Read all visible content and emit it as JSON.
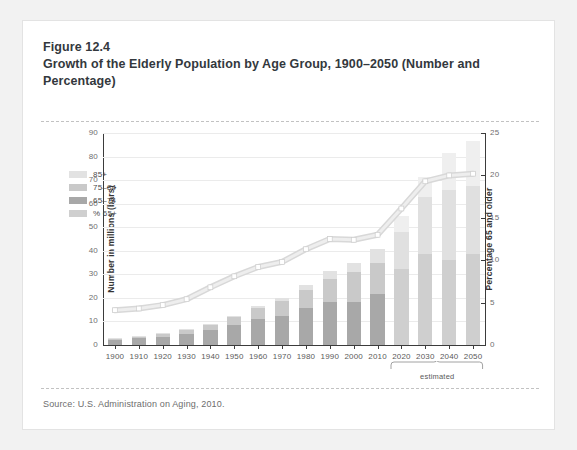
{
  "figure": {
    "number": "Figure 12.4",
    "title": "Growth of the Elderly Population by Age Group, 1900–2050 (Number and Percentage)",
    "source": "Source: U.S. Administration on Aging, 2010."
  },
  "colors": {
    "card_background": "#ffffff",
    "page_background": "#f2f2f2",
    "seg_65_74": "#a8a8a8",
    "seg_75_84": "#c9c9c9",
    "seg_85_plus": "#e2e2e2",
    "seg_65_74_proj": "#cfcfcf",
    "seg_75_84_proj": "#e0e0e0",
    "seg_85_plus_proj": "#efefef",
    "line_percent": "#cfcfcf",
    "line_marker": "#ffffff",
    "axis": "#3b3b3b",
    "gridline": "#ebebeb",
    "dashed_rule": "#c2c2c2"
  },
  "chart_data": {
    "type": "bar",
    "title": "Growth of the Elderly Population by Age Group, 1900–2050 (Number and Percentage)",
    "xlabel": "",
    "ylabel": "Number in millions (bars)",
    "y2label": "Percentage 65 and older",
    "ylim": [
      0,
      90
    ],
    "y2lim": [
      0,
      25
    ],
    "yticks": [
      0,
      10,
      20,
      30,
      40,
      50,
      60,
      70,
      80,
      90
    ],
    "y2ticks": [
      0,
      5,
      10,
      15,
      20,
      25
    ],
    "grid": true,
    "legend_position": "upper-left-inside",
    "stacked": true,
    "categories": [
      "1900",
      "1910",
      "1920",
      "1930",
      "1940",
      "1950",
      "1960",
      "1970",
      "1980",
      "1990",
      "2000",
      "2010",
      "2020",
      "2030",
      "2040",
      "2050"
    ],
    "projected_categories": [
      "2020",
      "2030",
      "2040",
      "2050"
    ],
    "annotation": "estimated",
    "series": [
      {
        "name": "65–74",
        "axis": "left",
        "values": [
          2.2,
          2.8,
          3.5,
          4.7,
          6.4,
          8.4,
          11.0,
          12.5,
          15.6,
          18.1,
          18.4,
          21.7,
          32.3,
          38.6,
          36.0,
          38.5
        ]
      },
      {
        "name": "75–84",
        "axis": "left",
        "values": [
          0.8,
          1.0,
          1.3,
          1.8,
          2.3,
          3.3,
          4.6,
          6.1,
          7.7,
          10.1,
          12.4,
          13.1,
          15.8,
          24.1,
          30.0,
          29.2
        ]
      },
      {
        "name": "85+",
        "axis": "left",
        "values": [
          0.1,
          0.2,
          0.2,
          0.3,
          0.4,
          0.6,
          0.9,
          1.4,
          2.2,
          3.1,
          4.2,
          5.8,
          6.6,
          8.7,
          15.4,
          19.0
        ]
      },
      {
        "name": "% 65+",
        "axis": "right",
        "type": "line",
        "values": [
          4.1,
          4.3,
          4.7,
          5.4,
          6.8,
          8.1,
          9.2,
          9.8,
          11.3,
          12.5,
          12.4,
          13.0,
          16.1,
          19.3,
          20.0,
          20.2
        ]
      }
    ],
    "totals": [
      3.1,
      4.0,
      5.0,
      6.8,
      9.1,
      12.3,
      16.5,
      20.0,
      25.5,
      31.3,
      35.0,
      40.6,
      54.7,
      71.4,
      81.4,
      86.7
    ]
  },
  "legend": {
    "items": [
      {
        "label": "85+",
        "key": "seg_85_plus"
      },
      {
        "label": "75–84",
        "key": "seg_75_84"
      },
      {
        "label": "65–74",
        "key": "seg_65_74"
      },
      {
        "label": "% 65+",
        "key": "line_percent"
      }
    ]
  }
}
